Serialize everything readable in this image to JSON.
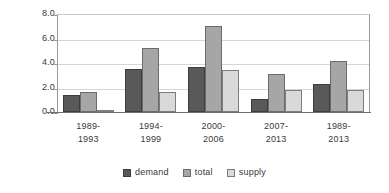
{
  "chart_data": {
    "type": "bar",
    "title": "",
    "subtitle": "",
    "xlabel": "",
    "ylabel": "",
    "categories": [
      "1989-\n1993",
      "1994-\n1999",
      "2000-\n2006",
      "2007-\n2013",
      "1989-\n2013"
    ],
    "category_lines": [
      [
        "1989-",
        "1993"
      ],
      [
        "1994-",
        "1999"
      ],
      [
        "2000-",
        "2006"
      ],
      [
        "2007-",
        "2013"
      ],
      [
        "1989-",
        "2013"
      ]
    ],
    "series": [
      {
        "name": "demand",
        "color": "#595959",
        "values": [
          1.4,
          3.5,
          3.7,
          1.1,
          2.3
        ]
      },
      {
        "name": "total",
        "color": "#a6a6a6",
        "values": [
          1.6,
          5.2,
          7.0,
          3.1,
          4.2
        ]
      },
      {
        "name": "supply",
        "color": "#d9d9d9",
        "values": [
          0.1,
          1.6,
          3.4,
          1.8,
          1.8
        ]
      }
    ],
    "ylim": [
      0.0,
      8.0
    ],
    "ytick_step": 2.0,
    "yticks": [
      0.0,
      2.0,
      4.0,
      6.0,
      8.0
    ],
    "ytick_labels": [
      "0.0",
      "2.0",
      "4.0",
      "6.0",
      "8.0"
    ],
    "grid": true,
    "grid_axis": "y",
    "legend_position": "bottom",
    "legend_entries": [
      "demand",
      "total",
      "supply"
    ]
  }
}
